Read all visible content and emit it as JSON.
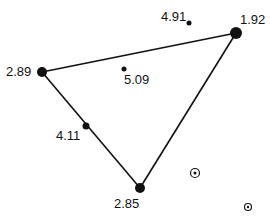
{
  "diagram": {
    "type": "triangle-graph",
    "vertices": [
      {
        "id": "v1",
        "label": "2.89",
        "kind": "large"
      },
      {
        "id": "v2",
        "label": "1.92",
        "kind": "large"
      },
      {
        "id": "v3",
        "label": "2.85",
        "kind": "large"
      }
    ],
    "edge_points": [
      {
        "id": "e1",
        "label": "4.11",
        "kind": "medium"
      }
    ],
    "free_points": [
      {
        "id": "p1",
        "label": "4.91",
        "kind": "small"
      },
      {
        "id": "p2",
        "label": "5.09",
        "kind": "small"
      }
    ],
    "target_markers": [
      {
        "id": "t1",
        "label": ""
      },
      {
        "id": "t2",
        "label": ""
      }
    ],
    "edges": [
      [
        "v1",
        "v2"
      ],
      [
        "v2",
        "v3"
      ],
      [
        "v3",
        "v1"
      ]
    ],
    "colors": {
      "ink": "#111111",
      "background": "#ffffff"
    }
  }
}
